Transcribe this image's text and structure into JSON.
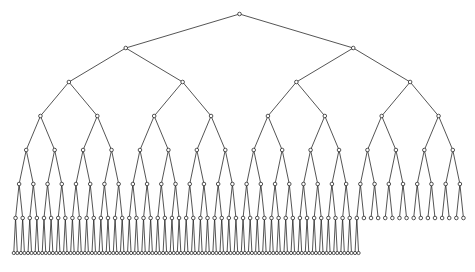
{
  "caption": {
    "text": "",
    "note": "partially clipped text at top edge, only descenders visible"
  },
  "diagram": {
    "type": "binary-tree",
    "line_color": "#2a2a2a",
    "node_fill": "#ffffff",
    "node_stroke": "#2a2a2a",
    "node_radius": 1.8,
    "leaf_radius": 1.6,
    "x_start": 12,
    "x_end": 467,
    "levels": [
      {
        "depth": 0,
        "y": 14,
        "count": 1
      },
      {
        "depth": 1,
        "y": 48,
        "count": 2
      },
      {
        "depth": 2,
        "y": 82,
        "count": 4
      },
      {
        "depth": 3,
        "y": 116,
        "count": 8
      },
      {
        "depth": 4,
        "y": 150,
        "count": 16
      },
      {
        "depth": 5,
        "y": 184,
        "count": 32
      },
      {
        "depth": 6,
        "y": 218,
        "count": 64
      },
      {
        "depth": 7,
        "y": 253,
        "count": 98
      }
    ],
    "total_slots_deepest_level": 128
  }
}
